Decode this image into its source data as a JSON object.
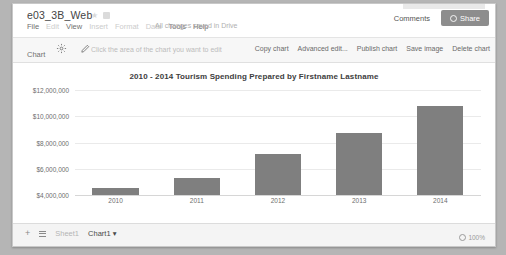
{
  "window": {
    "doc_title": "e03_3B_Web"
  },
  "header": {
    "menu_items": [
      {
        "label": "File",
        "dim": false
      },
      {
        "label": "Edit",
        "dim": true
      },
      {
        "label": "View",
        "dim": false
      },
      {
        "label": "Insert",
        "dim": true
      },
      {
        "label": "Format",
        "dim": true
      },
      {
        "label": "Data",
        "dim": true
      },
      {
        "label": "Tools",
        "dim": false
      },
      {
        "label": "Help",
        "dim": false
      }
    ],
    "save_state": "All changes saved in Drive",
    "comments_label": "Comments",
    "share_label": "Share"
  },
  "chart_toolbar": {
    "label": "Chart",
    "hint": "Click the area of the chart you want to edit",
    "buttons": [
      "Copy chart",
      "Advanced edit...",
      "Publish chart",
      "Save image",
      "Delete chart"
    ]
  },
  "bottom_bar": {
    "add_label": "+",
    "sheets": [
      {
        "label": "Sheet1",
        "active": false
      },
      {
        "label": "Chart1 ▾",
        "active": true
      }
    ],
    "zoom": "100%"
  },
  "chart_data": {
    "type": "bar",
    "title": "2010 - 2014 Tourism Spending Prepared by Firstname Lastname",
    "xlabel": "",
    "ylabel": "",
    "categories": [
      "2010",
      "2011",
      "2012",
      "2013",
      "2014"
    ],
    "values": [
      4500000,
      5300000,
      7100000,
      8700000,
      10800000
    ],
    "ylim": [
      4000000,
      12000000
    ],
    "ytick_labels": [
      "$12,000,000",
      "$10,000,000",
      "$8,000,000",
      "$6,000,000",
      "$4,000,000"
    ],
    "ytick_values": [
      12000000,
      10000000,
      8000000,
      6000000,
      4000000
    ],
    "grid": true,
    "legend": "none",
    "bar_color": "#7f7f7f"
  }
}
